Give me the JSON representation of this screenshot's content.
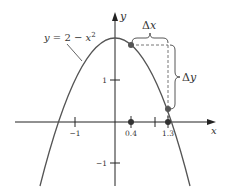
{
  "diagram": {
    "type": "function-graph",
    "equation_label": "y = 2 − x²",
    "equation_parts": {
      "lhs": "y",
      "rest": " = 2 − ",
      "var": "x",
      "exp": "2"
    },
    "axes": {
      "x_label": "x",
      "y_label": "y"
    },
    "x_ticks": [
      {
        "value": -1,
        "label": "−1"
      },
      {
        "value": 0.4,
        "label": "0.4",
        "marked_point": true
      },
      {
        "value": 1,
        "label": ""
      },
      {
        "value": 1.3,
        "label": "1.3",
        "marked_point": true
      }
    ],
    "y_ticks": [
      {
        "value": 1,
        "label": "1"
      },
      {
        "value": -1,
        "label": "−1"
      }
    ],
    "points": [
      {
        "x": 0.4,
        "y": 1.84
      },
      {
        "x": 1.3,
        "y": 0.31
      }
    ],
    "annotations": {
      "delta_x": "Δx",
      "delta_x_parts": {
        "delta": "Δ",
        "var": "x"
      },
      "delta_y": "Δy",
      "delta_y_parts": {
        "delta": "Δ",
        "var": "y"
      }
    },
    "colors": {
      "curve": "#555555",
      "axis": "#222222",
      "point": "#555555",
      "dashed": "#666666"
    }
  }
}
